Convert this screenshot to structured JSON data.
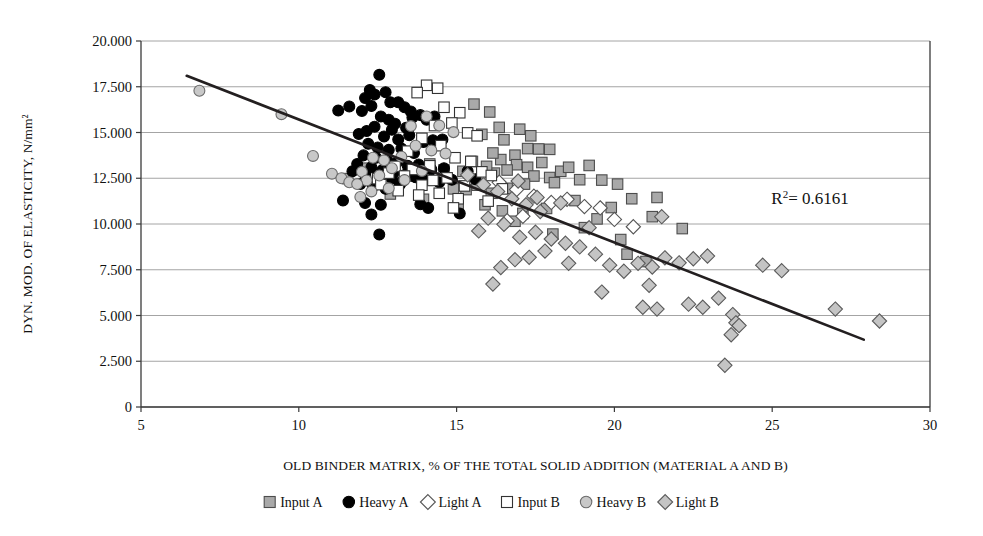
{
  "chart_data": {
    "type": "scatter",
    "title": "",
    "xlabel": "OLD BINDER MATRIX, % OF THE TOTAL SOLID ADDITION (MATERIAL A AND B)",
    "ylabel": "DYN. MOD. OF ELASTICITY, N/mm²",
    "xlim": [
      5,
      30
    ],
    "ylim": [
      0,
      20000
    ],
    "xticks": [
      5,
      10,
      15,
      20,
      25,
      30
    ],
    "xticklabels": [
      "5",
      "10",
      "15",
      "20",
      "25",
      "30"
    ],
    "yticks": [
      0,
      2500,
      5000,
      7500,
      10000,
      12500,
      15000,
      17500,
      20000
    ],
    "yticklabels": [
      "0",
      "2.500",
      "5.000",
      "7.500",
      "10.000",
      "12.500",
      "15.000",
      "17.500",
      "20.000"
    ],
    "grid": "horizontal",
    "legend_position": "bottom",
    "annotations": [
      {
        "name": "r-squared",
        "text_prefix": "R",
        "text_sup": "2",
        "text_suffix": "= 0.6161",
        "value": 0.6161,
        "x": 26.2,
        "y": 11100
      }
    ],
    "trendline": {
      "name": "linear-regression-line",
      "x_start": 6.45,
      "y_start": 18100,
      "x_end": 27.9,
      "y_end": 3680,
      "r_squared": 0.6161,
      "color": "#231f20"
    },
    "series": [
      {
        "name": "Input A",
        "key": "input-a",
        "marker": "square",
        "fill": "#a9a9a9",
        "stroke": "#4d4d4d",
        "points": [
          [
            15.55,
            16550
          ],
          [
            16.05,
            16120
          ],
          [
            16.35,
            15280
          ],
          [
            15.8,
            14900
          ],
          [
            16.5,
            14600
          ],
          [
            17.0,
            15180
          ],
          [
            17.35,
            14820
          ],
          [
            17.25,
            14120
          ],
          [
            16.85,
            13760
          ],
          [
            16.4,
            13520
          ],
          [
            16.15,
            13880
          ],
          [
            17.6,
            14100
          ],
          [
            17.95,
            14080
          ],
          [
            17.7,
            13360
          ],
          [
            17.25,
            13100
          ],
          [
            16.9,
            13240
          ],
          [
            16.6,
            12950
          ],
          [
            16.2,
            12780
          ],
          [
            15.95,
            13150
          ],
          [
            15.5,
            13420
          ],
          [
            15.2,
            12880
          ],
          [
            17.45,
            12620
          ],
          [
            17.95,
            12540
          ],
          [
            18.3,
            12880
          ],
          [
            18.55,
            13100
          ],
          [
            18.1,
            12260
          ],
          [
            17.15,
            12180
          ],
          [
            16.6,
            11950
          ],
          [
            16.1,
            11680
          ],
          [
            15.65,
            12120
          ],
          [
            15.3,
            11880
          ],
          [
            18.9,
            12420
          ],
          [
            19.2,
            13200
          ],
          [
            19.6,
            12400
          ],
          [
            20.1,
            12180
          ],
          [
            20.55,
            11380
          ],
          [
            21.35,
            11450
          ],
          [
            19.9,
            10900
          ],
          [
            18.75,
            11280
          ],
          [
            17.85,
            10850
          ],
          [
            17.1,
            10580
          ],
          [
            16.45,
            10720
          ],
          [
            16.85,
            10150
          ],
          [
            15.9,
            11050
          ],
          [
            14.6,
            12950
          ],
          [
            14.15,
            13280
          ],
          [
            13.7,
            12620
          ],
          [
            13.2,
            12420
          ],
          [
            12.65,
            12750
          ],
          [
            12.1,
            13050
          ],
          [
            11.55,
            12480
          ],
          [
            14.9,
            11920
          ],
          [
            15.05,
            10980
          ],
          [
            13.95,
            11350
          ],
          [
            12.9,
            11640
          ],
          [
            12.4,
            12180
          ],
          [
            21.2,
            10400
          ],
          [
            22.15,
            9750
          ],
          [
            19.05,
            9800
          ],
          [
            20.4,
            8350
          ],
          [
            21.0,
            7950
          ],
          [
            20.2,
            9150
          ],
          [
            19.45,
            10280
          ],
          [
            18.05,
            9450
          ]
        ]
      },
      {
        "name": "Heavy A",
        "key": "heavy-a",
        "marker": "circle",
        "fill": "#000000",
        "stroke": "#000000",
        "points": [
          [
            12.55,
            18150
          ],
          [
            12.25,
            17320
          ],
          [
            12.4,
            17080
          ],
          [
            12.1,
            16880
          ],
          [
            12.75,
            17200
          ],
          [
            12.9,
            16650
          ],
          [
            12.3,
            16450
          ],
          [
            12.0,
            16180
          ],
          [
            13.15,
            16650
          ],
          [
            13.35,
            16380
          ],
          [
            13.55,
            16150
          ],
          [
            11.6,
            16420
          ],
          [
            11.25,
            16200
          ],
          [
            12.6,
            15880
          ],
          [
            12.85,
            15700
          ],
          [
            13.05,
            15480
          ],
          [
            13.6,
            15820
          ],
          [
            13.85,
            15950
          ],
          [
            14.05,
            15700
          ],
          [
            14.3,
            15880
          ],
          [
            13.4,
            15260
          ],
          [
            12.95,
            15150
          ],
          [
            12.4,
            15320
          ],
          [
            12.15,
            15080
          ],
          [
            11.9,
            14920
          ],
          [
            12.7,
            14780
          ],
          [
            13.15,
            14620
          ],
          [
            13.5,
            14850
          ],
          [
            13.95,
            14480
          ],
          [
            14.25,
            14580
          ],
          [
            14.55,
            14620
          ],
          [
            12.2,
            14380
          ],
          [
            12.5,
            14180
          ],
          [
            12.85,
            14050
          ],
          [
            13.25,
            14120
          ],
          [
            13.65,
            13880
          ],
          [
            12.05,
            13750
          ],
          [
            12.45,
            13620
          ],
          [
            12.8,
            13480
          ],
          [
            13.1,
            13350
          ],
          [
            13.45,
            13180
          ],
          [
            13.8,
            13250
          ],
          [
            14.2,
            12980
          ],
          [
            14.6,
            13050
          ],
          [
            11.85,
            13280
          ],
          [
            12.3,
            13100
          ],
          [
            12.65,
            12950
          ],
          [
            13.0,
            12820
          ],
          [
            13.35,
            12680
          ],
          [
            13.7,
            12550
          ],
          [
            14.0,
            12420
          ],
          [
            11.7,
            12880
          ],
          [
            12.1,
            12720
          ],
          [
            12.5,
            12600
          ],
          [
            12.95,
            12480
          ],
          [
            13.3,
            12350
          ],
          [
            14.45,
            12280
          ],
          [
            14.85,
            12420
          ],
          [
            11.95,
            12180
          ],
          [
            12.35,
            12050
          ],
          [
            12.75,
            11920
          ],
          [
            13.2,
            12150
          ],
          [
            11.4,
            11280
          ],
          [
            12.1,
            11150
          ],
          [
            12.6,
            11050
          ],
          [
            13.85,
            11080
          ],
          [
            14.1,
            10880
          ],
          [
            12.3,
            10520
          ],
          [
            12.55,
            9420
          ],
          [
            15.1,
            10580
          ],
          [
            15.35,
            12880
          ],
          [
            15.6,
            12450
          ]
        ]
      },
      {
        "name": "Light A",
        "key": "light-a",
        "marker": "diamond",
        "fill": "#ffffff",
        "stroke": "#555555",
        "points": [
          [
            16.35,
            12280
          ],
          [
            16.9,
            11880
          ],
          [
            17.45,
            11520
          ],
          [
            18.0,
            11180
          ],
          [
            18.5,
            11350
          ],
          [
            19.05,
            10950
          ],
          [
            17.1,
            10420
          ],
          [
            16.6,
            10180
          ],
          [
            19.55,
            10880
          ],
          [
            20.0,
            10250
          ],
          [
            20.6,
            9850
          ]
        ]
      },
      {
        "name": "Input B",
        "key": "input-b",
        "marker": "square",
        "fill": "#ffffff",
        "stroke": "#333333",
        "points": [
          [
            14.05,
            17580
          ],
          [
            14.4,
            17420
          ],
          [
            13.75,
            17180
          ],
          [
            14.6,
            16380
          ],
          [
            15.1,
            16080
          ],
          [
            14.85,
            15520
          ],
          [
            14.3,
            15380
          ],
          [
            15.35,
            14980
          ],
          [
            15.65,
            14820
          ],
          [
            13.9,
            14680
          ],
          [
            14.5,
            14280
          ],
          [
            13.45,
            13980
          ],
          [
            14.95,
            13620
          ],
          [
            15.45,
            13420
          ],
          [
            14.15,
            13180
          ],
          [
            13.6,
            12980
          ],
          [
            13.05,
            13150
          ],
          [
            15.8,
            12850
          ],
          [
            16.1,
            12650
          ],
          [
            14.7,
            12520
          ],
          [
            14.25,
            12380
          ],
          [
            13.35,
            12620
          ],
          [
            12.85,
            12780
          ],
          [
            12.5,
            12480
          ],
          [
            13.9,
            12120
          ],
          [
            15.25,
            12080
          ],
          [
            16.45,
            11920
          ],
          [
            14.45,
            11680
          ],
          [
            13.8,
            11580
          ],
          [
            13.15,
            11820
          ],
          [
            12.6,
            12150
          ],
          [
            15.05,
            11380
          ],
          [
            16.0,
            11250
          ],
          [
            14.9,
            10880
          ]
        ]
      },
      {
        "name": "Heavy B",
        "key": "heavy-b",
        "marker": "circle",
        "fill": "#c8c8c8",
        "stroke": "#6b6b6b",
        "points": [
          [
            6.85,
            17280
          ],
          [
            9.45,
            16000
          ],
          [
            10.45,
            13720
          ],
          [
            11.05,
            12750
          ],
          [
            11.35,
            12500
          ],
          [
            11.6,
            12280
          ],
          [
            12.0,
            12850
          ],
          [
            12.35,
            13620
          ],
          [
            12.7,
            13480
          ],
          [
            12.95,
            13050
          ],
          [
            12.55,
            12650
          ],
          [
            12.15,
            12380
          ],
          [
            11.85,
            12180
          ],
          [
            13.25,
            13680
          ],
          [
            13.55,
            15350
          ],
          [
            14.05,
            15880
          ],
          [
            14.45,
            15380
          ],
          [
            14.9,
            15020
          ],
          [
            13.9,
            12900
          ],
          [
            13.35,
            12400
          ],
          [
            12.85,
            11950
          ],
          [
            12.3,
            11780
          ],
          [
            11.95,
            11480
          ],
          [
            13.7,
            14280
          ],
          [
            14.2,
            14020
          ],
          [
            14.65,
            13850
          ]
        ]
      },
      {
        "name": "Light B",
        "key": "light-b",
        "marker": "diamond",
        "fill": "#c4c4c4",
        "stroke": "#5a5a5a",
        "points": [
          [
            15.35,
            12680
          ],
          [
            15.85,
            12150
          ],
          [
            16.3,
            11780
          ],
          [
            16.75,
            11380
          ],
          [
            17.2,
            11050
          ],
          [
            17.65,
            10680
          ],
          [
            16.0,
            10320
          ],
          [
            16.5,
            9980
          ],
          [
            15.7,
            9620
          ],
          [
            17.0,
            9280
          ],
          [
            17.5,
            9550
          ],
          [
            18.0,
            9180
          ],
          [
            18.45,
            8950
          ],
          [
            17.8,
            8520
          ],
          [
            17.3,
            8180
          ],
          [
            16.85,
            8050
          ],
          [
            16.4,
            7620
          ],
          [
            16.15,
            6720
          ],
          [
            18.9,
            8750
          ],
          [
            19.4,
            8350
          ],
          [
            18.55,
            7850
          ],
          [
            19.85,
            7750
          ],
          [
            20.3,
            7420
          ],
          [
            19.6,
            6280
          ],
          [
            20.75,
            7850
          ],
          [
            21.2,
            7650
          ],
          [
            21.6,
            8150
          ],
          [
            21.1,
            6650
          ],
          [
            20.9,
            5450
          ],
          [
            21.35,
            5350
          ],
          [
            22.05,
            7880
          ],
          [
            22.5,
            8100
          ],
          [
            22.95,
            8250
          ],
          [
            22.35,
            5620
          ],
          [
            22.8,
            5450
          ],
          [
            23.3,
            5950
          ],
          [
            23.75,
            5050
          ],
          [
            23.85,
            4600
          ],
          [
            23.95,
            4450
          ],
          [
            23.7,
            3950
          ],
          [
            23.5,
            2280
          ],
          [
            24.7,
            7750
          ],
          [
            25.3,
            7450
          ],
          [
            27.0,
            5350
          ],
          [
            28.4,
            4700
          ],
          [
            19.2,
            9800
          ],
          [
            21.5,
            10400
          ],
          [
            18.3,
            11150
          ],
          [
            17.55,
            11450
          ],
          [
            16.95,
            12350
          ]
        ]
      }
    ]
  },
  "legend": {
    "items": [
      {
        "label": "Input A",
        "key": "input-a",
        "marker": "square",
        "fill": "#a9a9a9",
        "stroke": "#4d4d4d"
      },
      {
        "label": "Heavy A",
        "key": "heavy-a",
        "marker": "circle",
        "fill": "#000000",
        "stroke": "#000000"
      },
      {
        "label": "Light A",
        "key": "light-a",
        "marker": "diamond",
        "fill": "#ffffff",
        "stroke": "#555555"
      },
      {
        "label": "Input B",
        "key": "input-b",
        "marker": "square",
        "fill": "#ffffff",
        "stroke": "#333333"
      },
      {
        "label": "Heavy B",
        "key": "heavy-b",
        "marker": "circle",
        "fill": "#c8c8c8",
        "stroke": "#6b6b6b"
      },
      {
        "label": "Light B",
        "key": "light-b",
        "marker": "diamond",
        "fill": "#c4c4c4",
        "stroke": "#5a5a5a"
      }
    ]
  },
  "colors": {
    "axis": "#3a3a3a",
    "grid": "#9a9a9a",
    "trend": "#231f20",
    "background": "#ffffff"
  }
}
